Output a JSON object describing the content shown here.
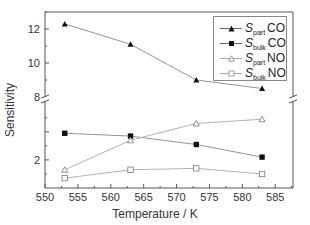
{
  "chart_data": {
    "type": "line",
    "title": "",
    "xlabel": "Temperature / K",
    "ylabel": "Sensitivity",
    "x": [
      553,
      563,
      573,
      583
    ],
    "xlim": [
      550,
      587.7
    ],
    "xticks": [
      550,
      555,
      560,
      565,
      570,
      575,
      580,
      585
    ],
    "y_axis_broken": true,
    "y_segments": [
      {
        "name": "lower",
        "ylim": [
          0,
          6.2
        ],
        "ticks": [
          2,
          4
        ],
        "tick_labels": [
          "2",
          ""
        ]
      },
      {
        "name": "upper",
        "ylim": [
          8,
          13
        ],
        "ticks": [
          8,
          10,
          12
        ],
        "tick_labels": [
          "8",
          "10",
          "12"
        ]
      }
    ],
    "grid": false,
    "legend_position": "upper right",
    "series": [
      {
        "name": "S_part CO",
        "label_main": "S",
        "label_sub": "part",
        "label_gas": "CO",
        "marker": "filled-triangle",
        "segment": "upper",
        "values": [
          12.3,
          11.1,
          9.0,
          8.5
        ]
      },
      {
        "name": "S_bulk CO",
        "label_main": "S",
        "label_sub": "bulk",
        "label_gas": "CO",
        "marker": "filled-square",
        "segment": "lower",
        "values": [
          3.9,
          3.7,
          3.1,
          2.2
        ]
      },
      {
        "name": "S_part NO",
        "label_main": "S",
        "label_sub": "part",
        "label_gas": "NO",
        "marker": "open-triangle",
        "segment": "lower",
        "values": [
          1.3,
          3.4,
          4.6,
          4.9
        ]
      },
      {
        "name": "S_bulk NO",
        "label_main": "S",
        "label_sub": "bulk",
        "label_gas": "NO",
        "marker": "open-square",
        "segment": "lower",
        "values": [
          0.7,
          1.3,
          1.4,
          1.0
        ]
      }
    ]
  },
  "legend": {
    "items": [
      {
        "main": "S",
        "sub": "part",
        "gas": "CO"
      },
      {
        "main": "S",
        "sub": "bulk",
        "gas": "CO"
      },
      {
        "main": "S",
        "sub": "part",
        "gas": "NO"
      },
      {
        "main": "S",
        "sub": "bulk",
        "gas": "NO"
      }
    ]
  },
  "axes": {
    "xlabel": "Temperature / K",
    "ylabel": "Sensitivity",
    "x_tick_labels": [
      "550",
      "555",
      "560",
      "565",
      "570",
      "575",
      "580",
      "585"
    ],
    "y_tick_labels_upper": [
      "12",
      "10",
      "8"
    ],
    "y_tick_labels_lower": [
      "2"
    ]
  },
  "colors": {
    "axis": "#555555",
    "line": "#888888",
    "marker_filled": "#111111",
    "marker_open_stroke": "#777777"
  }
}
